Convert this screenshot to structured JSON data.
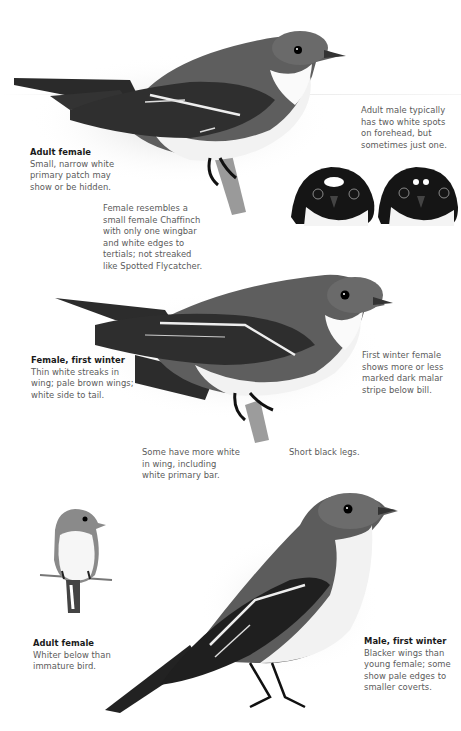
{
  "plate": {
    "subject": "Pied Flycatcher illustrations",
    "captions": [
      {
        "id": "adult-female-top",
        "title": "Adult female",
        "lines": [
          "Small, narrow white",
          "primary patch may",
          "show or be hidden."
        ]
      },
      {
        "id": "adult-male-forehead",
        "title": "",
        "lines": [
          "Adult male typically",
          "has two white spots",
          "on forehead, but",
          "sometimes just one."
        ]
      },
      {
        "id": "female-chaffinch",
        "title": "",
        "lines": [
          "Female resembles a",
          "small female Chaffinch",
          "with only one wingbar",
          "and white edges to",
          "tertials; not streaked",
          "like Spotted Flycatcher."
        ]
      },
      {
        "id": "female-first-winter",
        "title": "Female, first winter",
        "lines": [
          "Thin white streaks in",
          "wing; pale brown wings;",
          "white side to tail."
        ]
      },
      {
        "id": "first-winter-malar",
        "title": "",
        "lines": [
          "First winter female",
          "shows more or less",
          "marked dark malar",
          "stripe below bill."
        ]
      },
      {
        "id": "more-white-wing",
        "title": "",
        "lines": [
          "Some have more white",
          "in wing, including",
          "white primary bar."
        ]
      },
      {
        "id": "short-legs",
        "title": "",
        "lines": [
          "Short black legs."
        ]
      },
      {
        "id": "adult-female-bottom",
        "title": "Adult female",
        "lines": [
          "Whiter below than",
          "immature bird."
        ]
      },
      {
        "id": "male-first-winter",
        "title": "Male, first winter",
        "lines": [
          "Blacker wings than",
          "young female; some",
          "show pale edges to",
          "smaller coverts."
        ]
      }
    ],
    "illustrations": [
      {
        "id": "adult-female-perched",
        "label": "adult-female-bird"
      },
      {
        "id": "male-heads",
        "label": "adult-male-heads"
      },
      {
        "id": "female-first-winter-perched",
        "label": "female-first-winter-bird"
      },
      {
        "id": "adult-female-front",
        "label": "adult-female-front-bird"
      },
      {
        "id": "male-first-winter-standing",
        "label": "male-first-winter-bird"
      }
    ]
  }
}
